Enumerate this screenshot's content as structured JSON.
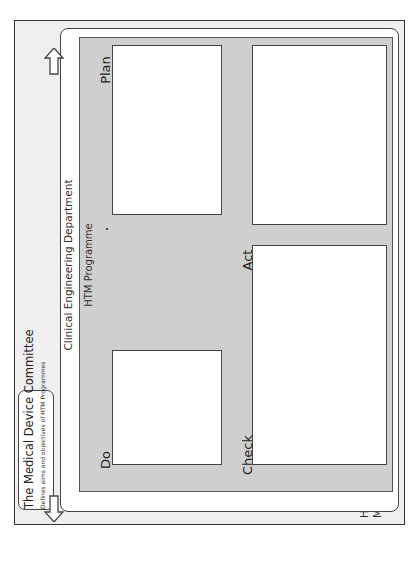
{
  "system": {
    "title_line1": "Healthcare Technology",
    "title_line2": "Management System"
  },
  "committee": {
    "title": "The Medical Device Committee",
    "subtitle": "Defines aims and objectives of HTM Programmes"
  },
  "department": {
    "title": "Clinical  Engineering Department"
  },
  "programme": {
    "title": "HTM Programme"
  },
  "quadrants": {
    "plan": {
      "title": "Plan",
      "step1": {
        "label": "Step 1:",
        "text": "Group equipment into support groups"
      },
      "step2": {
        "label": "Step 2:",
        "text": "Estimate impact of equipment failure on:",
        "bullets": [
          "• Clinical Care",
          "• Business Continuity",
          "• Finance"
        ]
      },
      "step3": {
        "label": "Step 3:",
        "text": "Prioritise equipment groups for review of their ESP"
      }
    },
    "do": {
      "title": "Do",
      "step4": {
        "label": "Step 4:",
        "text": "Develop ideal ESP for equipment groups"
      },
      "step5": {
        "label": "Step 5:",
        "text": "Assign available resources to equipment groups to meet ideal ESP aims and objectives"
      },
      "step6": {
        "label": "Step 6:",
        "text": "Identify and communicate any residual risk"
      },
      "step7": {
        "label": "Step 7:",
        "text": "Set ESP into action"
      }
    },
    "act": {
      "title": "Act",
      "step10": {
        "label": "Step 10:",
        "text": "Act to improve equipment grouping."
      },
      "step11": {
        "label": "Step 11:",
        "text": "Revise estimated impact of equipment failure on:",
        "bullets": [
          "• Clinical Care",
          "• Business Continuity",
          "• Finance"
        ]
      },
      "step12": {
        "label": "Step 12:",
        "text": "Develop a Quality Improvement Plan for the HTM programme"
      },
      "step13": {
        "label": "Step 13:",
        "text": "Report HTM performance, residual risks and requirements for QIP to the MDC."
      }
    },
    "check": {
      "title": "Check",
      "step8": {
        "label": "Step 8:",
        "text": "Manage ESP delivery and check they are running (KPIs for individual ESPs)"
      },
      "step9": {
        "label": "Step 9:",
        "text": "Manage the portfolio of ESPs and check the HTM Programme is running (KPIs for each HTM Programme)"
      }
    }
  },
  "colors": {
    "outer_bg": "#efefef",
    "programme_bg": "#cfcfcf",
    "box_bg": "#ffffff",
    "border": "#333333"
  }
}
